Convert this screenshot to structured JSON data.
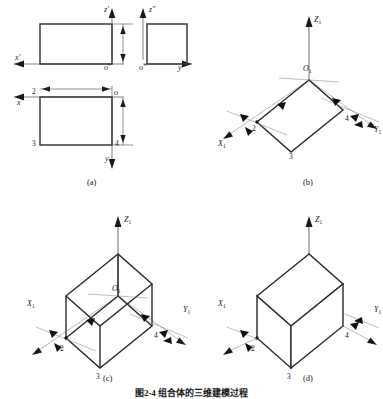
{
  "figure": {
    "caption": "图2-4  组合体的三维建模过程",
    "panels": [
      {
        "id": "a",
        "label": "(a)",
        "kind": "three-view-projection",
        "description": "Front, side and top orthographic views of a rectangular block",
        "views": [
          {
            "name": "front-view",
            "axis_vertical": "z'",
            "axis_horizontal": "x'",
            "origin": "o'",
            "shape": "rectangle",
            "width_px": 86,
            "height_px": 44
          },
          {
            "name": "side-view",
            "axis_vertical": "z\"",
            "axis_horizontal": "y\"",
            "origin": "o\"",
            "shape": "square",
            "width_px": 44,
            "height_px": 44
          },
          {
            "name": "top-view",
            "axis_vertical": "y",
            "axis_horizontal": "x",
            "origin": "o",
            "shape": "rectangle",
            "width_px": 86,
            "height_px": 52,
            "vertices": [
              "2",
              "3",
              "4"
            ]
          }
        ],
        "dimension_arrows": [
          "horizontal-width",
          "vertical-height",
          "vertical-depth"
        ]
      },
      {
        "id": "b",
        "label": "(b)",
        "kind": "isometric-base-face",
        "description": "Base parallelogram sketched on the X1-Y1 plane of the 3D coordinate system",
        "axes": {
          "z": "Z",
          "z_sub": "1",
          "x": "X",
          "x_sub": "1",
          "y": "Y",
          "y_sub": "1"
        },
        "origin": {
          "text": "O",
          "sub": "1"
        },
        "vertices": [
          "2",
          "3",
          "4"
        ],
        "constraint_markers": 6
      },
      {
        "id": "c",
        "label": "(c)",
        "kind": "isometric-wireframe-box",
        "description": "Extruded wireframe box showing hidden edges",
        "axes": {
          "z": "Z",
          "z_sub": "1",
          "x": "X",
          "x_sub": "1",
          "y": "Y",
          "y_sub": "1"
        },
        "origin": {
          "text": "O",
          "sub": "1"
        },
        "vertices": [
          "2",
          "3",
          "4"
        ],
        "constraint_markers": 6
      },
      {
        "id": "d",
        "label": "(d)",
        "kind": "isometric-solid-box",
        "description": "Finished solid box with hidden edges removed",
        "axes": {
          "z": "Z",
          "z_sub": "1",
          "x": "X",
          "x_sub": "1",
          "y": "Y",
          "y_sub": "1"
        },
        "vertices": [
          "2",
          "3",
          "4"
        ],
        "constraint_markers": 4
      }
    ],
    "colors": {
      "background": "#ffffff",
      "line": "#3a3a3a",
      "line_heavy": "#2b2b2b",
      "thin_axis": "#8a8a8a",
      "text": "#1a1a1a"
    }
  }
}
